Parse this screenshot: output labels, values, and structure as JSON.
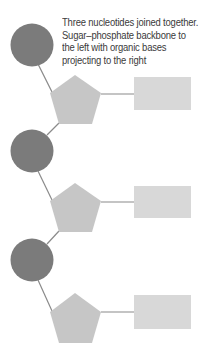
{
  "caption": {
    "lines": [
      "Three nucleotides joined together.",
      "Sugar–phosphate backbone to",
      "the left with organic bases",
      "projecting to the right"
    ]
  },
  "legend_semantics": {
    "circle": "phosphate",
    "pentagon": "sugar",
    "rectangle": "organic base"
  },
  "colors": {
    "phosphate": "#7b7b7b",
    "sugar": "#c6c6c6",
    "base": "#d8d8d8",
    "line": "#8a8a8a"
  },
  "nucleotides": [
    {
      "index": 1,
      "phosphate": {
        "cx": 32,
        "cy": 45,
        "r": 21
      },
      "sugar_top": 75,
      "base": {
        "x": 134,
        "y": 77,
        "w": 57,
        "h": 33
      }
    },
    {
      "index": 2,
      "phosphate": {
        "cx": 32,
        "cy": 151,
        "r": 21
      },
      "sugar_top": 183,
      "base": {
        "x": 134,
        "y": 186,
        "w": 57,
        "h": 32
      }
    },
    {
      "index": 3,
      "phosphate": {
        "cx": 32,
        "cy": 260,
        "r": 21
      },
      "sugar_top": 293,
      "base": {
        "x": 134,
        "y": 295,
        "w": 57,
        "h": 34
      }
    }
  ]
}
